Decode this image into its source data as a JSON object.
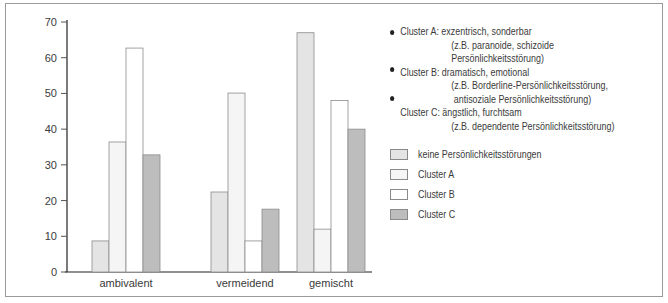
{
  "chart_data": {
    "type": "bar",
    "title": "",
    "xlabel": "",
    "ylabel": "",
    "ylim": [
      0,
      70
    ],
    "yticks": [
      0,
      10,
      20,
      30,
      40,
      50,
      60,
      70
    ],
    "grid": false,
    "legend_position": "right",
    "categories": [
      "ambivalent",
      "vermeidend",
      "gemischt"
    ],
    "series": [
      {
        "name": "keine Persönlichkeitsstörungen",
        "color": "#e4e4e4",
        "values": [
          8.7,
          22.4,
          67
        ]
      },
      {
        "name": "Cluster A",
        "color": "#f5f5f5",
        "values": [
          36.4,
          50.1,
          12
        ]
      },
      {
        "name": "Cluster B",
        "color": "#ffffff",
        "values": [
          62.7,
          8.7,
          48
        ]
      },
      {
        "name": "Cluster C",
        "color": "#bdbdbd",
        "values": [
          32.8,
          17.6,
          40
        ]
      }
    ]
  },
  "annotations": {
    "cluster_a": {
      "label": "Cluster A: exzentrisch, sonderbar",
      "example": "(z.B. paranoide, schizoide Persönlichkeitsstörung)"
    },
    "cluster_b": {
      "label": "Cluster B: dramatisch, emotional",
      "example_1": "(z.B. Borderline-Persönlichkeitsstörung,",
      "example_2": "antisoziale Persönlichkeitsstörung)"
    },
    "cluster_c": {
      "label": "Cluster C: ängstlich, furchtsam",
      "example": "(z.B. dependente Persönlichkeitsstörung)"
    }
  },
  "legend": {
    "items": [
      {
        "label": "keine Persönlichkeitsstörungen",
        "color": "#e4e4e4"
      },
      {
        "label": "Cluster A",
        "color": "#f5f5f5"
      },
      {
        "label": "Cluster B",
        "color": "#ffffff"
      },
      {
        "label": "Cluster C",
        "color": "#bdbdbd"
      }
    ]
  }
}
